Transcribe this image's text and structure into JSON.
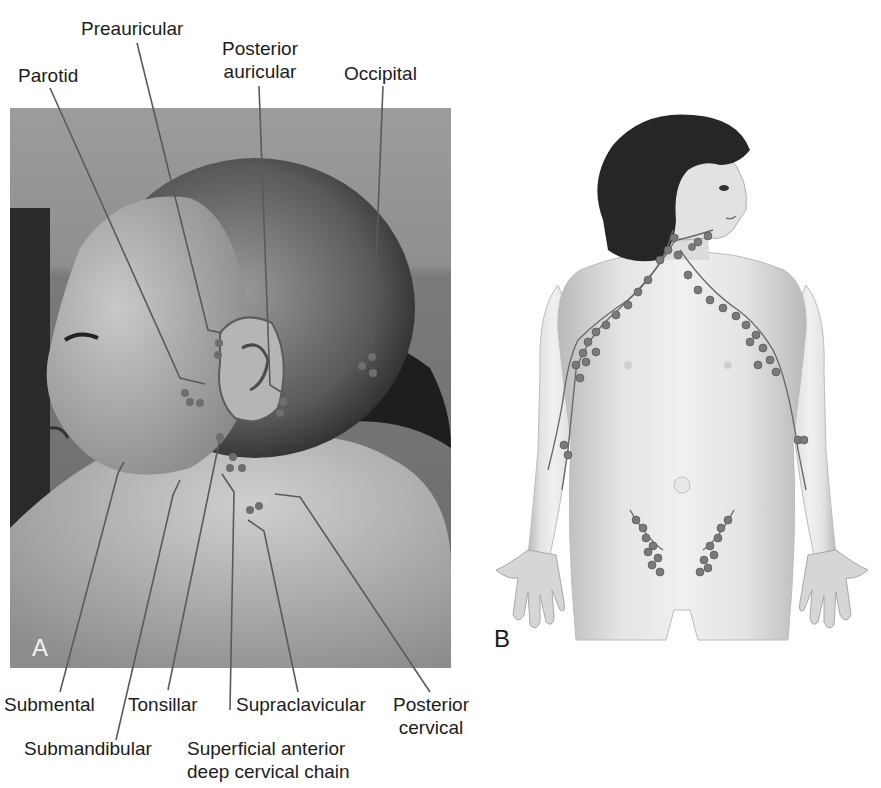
{
  "figure": {
    "panels": [
      {
        "id": "A",
        "letter": "A",
        "kind": "photograph",
        "subject": "infant head and neck, left lateral view with lymph node markers"
      },
      {
        "id": "B",
        "letter": "B",
        "kind": "illustration",
        "subject": "child upper body with lymph node chains (cervical, axillary, epitrochlear, inguinal)"
      }
    ],
    "labels_top": {
      "parotid": "Parotid",
      "preauricular": "Preauricular",
      "posterior_auricular_line1": "Posterior",
      "posterior_auricular_line2": "auricular",
      "occipital": "Occipital"
    },
    "labels_bottom": {
      "submental": "Submental",
      "submandibular": "Submandibular",
      "tonsillar": "Tonsillar",
      "superficial_line1": "Superficial anterior",
      "superficial_line2": "deep cervical chain",
      "supraclavicular": "Supraclavicular",
      "posterior_cervical_line1": "Posterior",
      "posterior_cervical_line2": "cervical"
    },
    "colors": {
      "leader_line": "#5a5a5a",
      "node_marker": "#6e6e6e",
      "text": "#1c1c1c",
      "background": "#ffffff"
    }
  }
}
